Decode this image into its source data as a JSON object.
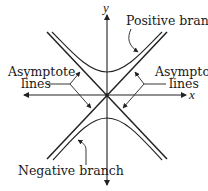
{
  "diagram": {
    "type": "hyperbola",
    "axes": {
      "x_label": "x",
      "y_label": "y"
    },
    "labels": {
      "positive_branch": "Positive branch",
      "negative_branch": "Negative branch",
      "asymptote_left_line1": "Asymptote",
      "asymptote_left_line2": "lines",
      "asymptote_right_line1": "Asymptote",
      "asymptote_right_line2": "lines"
    },
    "colors": {
      "stroke": "#222222",
      "background": "#ffffff"
    }
  }
}
